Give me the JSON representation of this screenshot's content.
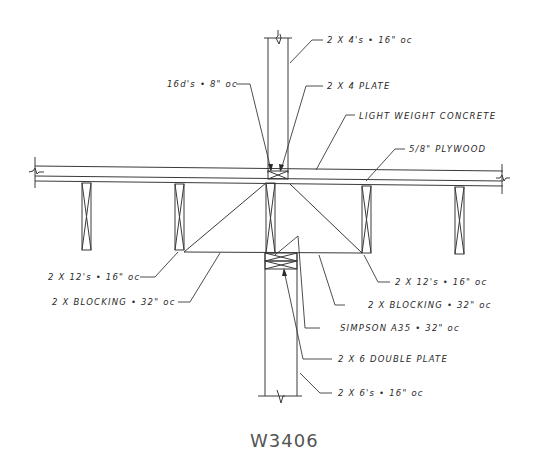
{
  "drawing": {
    "id": "W3406",
    "type": "structural framing section detail",
    "colors": {
      "line": "#3a3a3a",
      "text": "#2a2a2a",
      "background": "#ffffff"
    },
    "callouts": [
      {
        "key": "top_studs",
        "text": "2 X 4's • 16\" oc"
      },
      {
        "key": "nails",
        "text": "16d's • 8\" oc"
      },
      {
        "key": "top_plate",
        "text": "2 X 4 PLATE"
      },
      {
        "key": "concrete",
        "text": "LIGHT WEIGHT CONCRETE"
      },
      {
        "key": "plywood",
        "text": "5/8\" PLYWOOD"
      },
      {
        "key": "joists_left",
        "text": "2 X 12's • 16\" oc"
      },
      {
        "key": "blocking_left",
        "text": "2 X BLOCKING • 32\" oc"
      },
      {
        "key": "joists_right",
        "text": "2 X 12's • 16\" oc"
      },
      {
        "key": "blocking_right",
        "text": "2 X BLOCKING • 32\" oc"
      },
      {
        "key": "clip",
        "text": "SIMPSON A35 • 32\" oc"
      },
      {
        "key": "double_plate",
        "text": "2 X 6 DOUBLE PLATE"
      },
      {
        "key": "bottom_studs",
        "text": "2 X 6's • 16\" oc"
      }
    ]
  }
}
